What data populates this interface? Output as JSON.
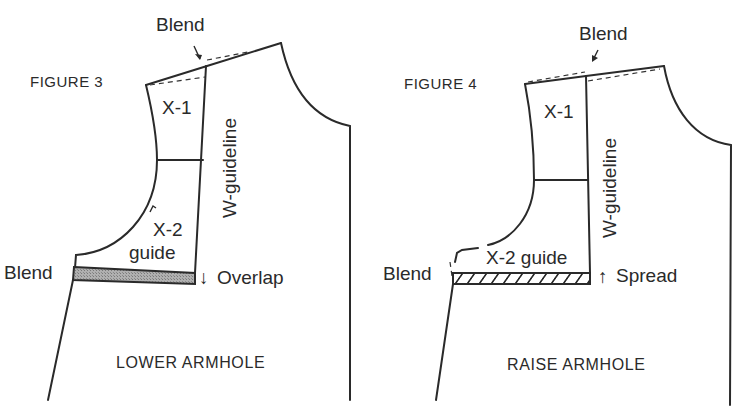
{
  "figures": [
    {
      "id": "figure-3",
      "title": "FIGURE 3",
      "caption": "LOWER ARMHOLE",
      "labels": {
        "blend_top": "Blend",
        "x1": "X-1",
        "x2_line1": "X-2",
        "x2_line2": "guide",
        "w_guideline": "W-guideline",
        "blend_side": "Blend",
        "adjustment": "Overlap",
        "adjustment_arrow": "↓"
      },
      "band_style": "shaded"
    },
    {
      "id": "figure-4",
      "title": "FIGURE 4",
      "caption": "RAISE ARMHOLE",
      "labels": {
        "blend_top": "Blend",
        "x1": "X-1",
        "x2": "X-2 guide",
        "w_guideline": "W-guideline",
        "blend_side": "Blend",
        "adjustment": "Spread",
        "adjustment_arrow": "↑"
      },
      "band_style": "hatched"
    }
  ],
  "colors": {
    "line": "#2a2a2a",
    "shade": "#9a9a9a",
    "background": "#ffffff"
  }
}
